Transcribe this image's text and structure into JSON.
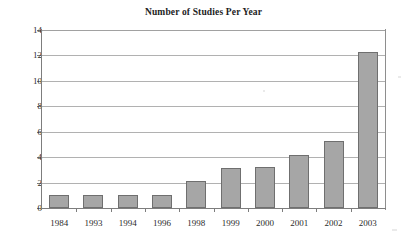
{
  "chart_data": {
    "type": "bar",
    "title": "Number of Studies Per Year",
    "xlabel": "",
    "ylabel": "",
    "categories": [
      "1984",
      "1993",
      "1994",
      "1996",
      "1998",
      "1999",
      "2000",
      "2001",
      "2002",
      "2003"
    ],
    "values": [
      1,
      1,
      1,
      1.05,
      2.1,
      3.15,
      3.2,
      4.2,
      5.25,
      12.25
    ],
    "ylim": [
      0,
      14
    ],
    "ytick_labels": [
      "0",
      "2",
      "4",
      "6",
      "8",
      "10",
      "12",
      "14"
    ],
    "ytick_values": [
      0,
      2,
      4,
      6,
      8,
      10,
      12,
      14
    ],
    "grid": true,
    "grid_axis": "y",
    "legend": false,
    "legend_position": "none",
    "bar_color": "#a6a6a6",
    "bar_border_color": "#6f6f6f",
    "gridline_color": "#9e9e9e",
    "axis_color": "#7d7d7d",
    "background_color": "#ffffff",
    "text_color": "#2b2b2b"
  }
}
